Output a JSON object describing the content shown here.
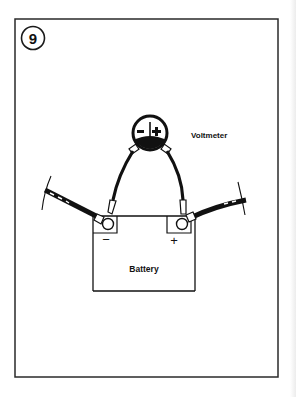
{
  "figure": {
    "number": "9",
    "components": {
      "meter_label": "Voltmeter",
      "battery_label": "Battery",
      "negative_symbol": "−",
      "positive_symbol": "+"
    }
  },
  "colors": {
    "ink": "#1a1a1a",
    "background": "#ffffff"
  }
}
